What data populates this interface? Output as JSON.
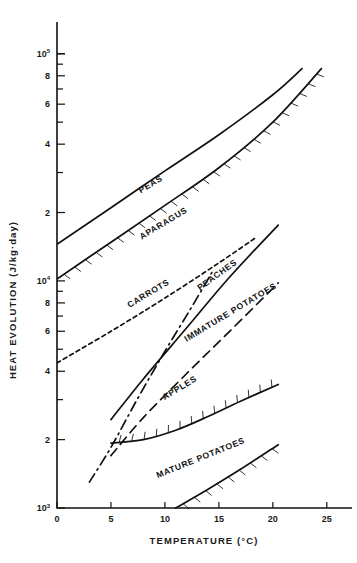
{
  "chart_data": {
    "type": "line",
    "title": "",
    "xlabel": "TEMPERATURE  (°C)",
    "ylabel": "HEAT EVOLUTION  (J/kg·day)",
    "ylabel_main": "HEAT EVOLUTION",
    "ylabel_units": "(J/kg·day)",
    "xlabel_main": "TEMPERATURE",
    "xlabel_units": "(°C)",
    "xlim": [
      0,
      26.5
    ],
    "ylim": [
      1000,
      115000
    ],
    "yscale": "log",
    "grid": false,
    "legend": "inline-curve-labels",
    "xticks": [
      0,
      5,
      10,
      15,
      20,
      25
    ],
    "xticklabels": [
      "0",
      "5",
      "10",
      "15",
      "20",
      "25"
    ],
    "yticks": [
      1000,
      2000,
      3000,
      4000,
      6000,
      8000,
      10000,
      20000,
      30000,
      40000,
      60000,
      80000,
      100000
    ],
    "yticklabels": [
      "10³",
      "2",
      "",
      "4",
      "6",
      "8",
      "10⁴",
      "2",
      "",
      "4",
      "6",
      "8",
      "10⁵"
    ],
    "ylabeled_ticks": [
      {
        "value": 1000,
        "text": "10",
        "sup": "3"
      },
      {
        "value": 2000,
        "text": "2",
        "sup": ""
      },
      {
        "value": 4000,
        "text": "4",
        "sup": ""
      },
      {
        "value": 6000,
        "text": "6",
        "sup": ""
      },
      {
        "value": 8000,
        "text": "8",
        "sup": ""
      },
      {
        "value": 10000,
        "text": "10",
        "sup": "4"
      },
      {
        "value": 20000,
        "text": "2",
        "sup": ""
      },
      {
        "value": 40000,
        "text": "4",
        "sup": ""
      },
      {
        "value": 60000,
        "text": "6",
        "sup": ""
      },
      {
        "value": 80000,
        "text": "8",
        "sup": ""
      },
      {
        "value": 100000,
        "text": "10",
        "sup": "5"
      }
    ],
    "series": [
      {
        "name": "PEAS",
        "label": "PEAS",
        "style": "solid",
        "hatched": false,
        "label_x": 8.8,
        "label_y": 26000,
        "label_rotation": -31,
        "points": [
          [
            0,
            14500
          ],
          [
            5,
            21000
          ],
          [
            10,
            30500
          ],
          [
            15,
            44000
          ],
          [
            20,
            66000
          ],
          [
            22.7,
            86000
          ]
        ]
      },
      {
        "name": "APARAGUS",
        "label": "APARAGUS",
        "style": "solid",
        "hatched": true,
        "hatch_side": "above",
        "label_x": 10.0,
        "label_y": 17500,
        "label_rotation": -31,
        "points": [
          [
            0,
            10200
          ],
          [
            5,
            14800
          ],
          [
            10,
            21500
          ],
          [
            15,
            31500
          ],
          [
            20,
            50000
          ],
          [
            24.5,
            86000
          ]
        ]
      },
      {
        "name": "CARROTS",
        "label": "CARROTS",
        "style": "dotted",
        "hatched": false,
        "label_x": 8.6,
        "label_y": 8600,
        "label_rotation": -31,
        "points": [
          [
            0,
            4350
          ],
          [
            5,
            6000
          ],
          [
            10,
            8400
          ],
          [
            15,
            12000
          ],
          [
            18.5,
            15600
          ]
        ]
      },
      {
        "name": "PEACHES",
        "label": "PEACHES",
        "style": "dashdot",
        "hatched": false,
        "label_x": 15.0,
        "label_y": 10400,
        "label_rotation": -36,
        "points": [
          [
            3,
            1300
          ],
          [
            5,
            1850
          ],
          [
            7.5,
            3050
          ],
          [
            10,
            4900
          ],
          [
            12.5,
            7700
          ],
          [
            14.5,
            11200
          ]
        ]
      },
      {
        "name": "IMMATURE POTATOES",
        "label": "IMMATURE POTATOES",
        "style": "solid",
        "hatched": false,
        "label_x": 16.2,
        "label_y": 7100,
        "label_rotation": -31,
        "points": [
          [
            5,
            2450
          ],
          [
            8,
            3700
          ],
          [
            12,
            6200
          ],
          [
            16,
            10400
          ],
          [
            20.5,
            17600
          ]
        ]
      },
      {
        "name": "APPLES",
        "label": "APPLES",
        "style": "dashed",
        "hatched": false,
        "label_x": 11.5,
        "label_y": 3300,
        "label_rotation": -31,
        "points": [
          [
            5,
            1700
          ],
          [
            8,
            2500
          ],
          [
            12,
            3900
          ],
          [
            16,
            6000
          ],
          [
            20.5,
            9800
          ]
        ]
      },
      {
        "name": "MATURE POTATOES (upper)",
        "label": "",
        "style": "solid",
        "hatched": true,
        "hatch_side": "below",
        "label_x": 0,
        "label_y": 0,
        "label_rotation": 0,
        "points": [
          [
            5,
            1930
          ],
          [
            8,
            2000
          ],
          [
            11,
            2200
          ],
          [
            14,
            2530
          ],
          [
            17,
            2950
          ],
          [
            20.5,
            3500
          ]
        ]
      },
      {
        "name": "MATURE POTATOES",
        "label": "MATURE POTATOES",
        "style": "solid",
        "hatched": true,
        "hatch_side": "above",
        "label_x": 13.4,
        "label_y": 1620,
        "label_rotation": -22,
        "points": [
          [
            11,
            1000
          ],
          [
            14,
            1210
          ],
          [
            17,
            1480
          ],
          [
            20.5,
            1900
          ]
        ]
      }
    ]
  },
  "figure": {
    "caption": ""
  }
}
